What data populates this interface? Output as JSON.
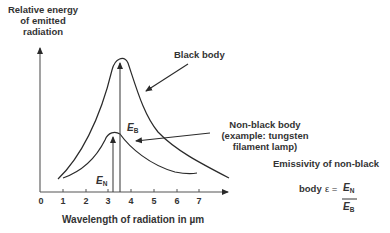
{
  "y_axis_label": [
    "Relative energy",
    "of emitted",
    "radiation"
  ],
  "x_axis_label": "Wavelength of radiation in  µm",
  "x_ticks": [
    "0",
    "1",
    "2",
    "3",
    "4",
    "5",
    "6",
    "7"
  ],
  "curves": {
    "black_body": {
      "label": "Black body",
      "marker": "E",
      "marker_sub": "B"
    },
    "non_black_body": {
      "label_lines": [
        "Non-black body",
        "(example: tungsten",
        "filament lamp)"
      ],
      "marker": "E",
      "marker_sub": "N"
    }
  },
  "formula": {
    "caption_line1": "Emissivity of non-black",
    "caption_line2": "body",
    "symbol": "ε =",
    "numerator": "E",
    "numerator_sub": "N",
    "denominator": "E",
    "denominator_sub": "B"
  },
  "colors": {
    "line": "#2a2a2a",
    "text": "#333333",
    "background": "#ffffff"
  }
}
